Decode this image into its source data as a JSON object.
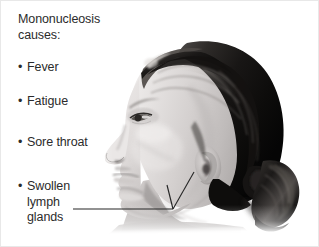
{
  "figure": {
    "background_color": "#ffffff",
    "text_color": "#2b2b2b",
    "line_color": "#262626",
    "heading": {
      "line1": "Mononucleosis",
      "line2": "causes:"
    },
    "symptoms": [
      {
        "bullet": "•",
        "lines": [
          "Fever"
        ]
      },
      {
        "bullet": "•",
        "lines": [
          "Fatigue"
        ]
      },
      {
        "bullet": "•",
        "lines": [
          "Sore throat"
        ]
      },
      {
        "bullet": "•",
        "lines": [
          "Swollen",
          "lymph",
          "glands"
        ]
      }
    ],
    "image": {
      "name": "profile-photo-woman-head-neck",
      "description": "Grayscale side profile photograph of a woman facing left with hair pulled back into a ponytail",
      "alt": "Side profile of a woman's head and neck"
    },
    "annotation": {
      "name": "swollen-lymph-glands-pointer",
      "target_label": "Swollen lymph glands"
    }
  }
}
